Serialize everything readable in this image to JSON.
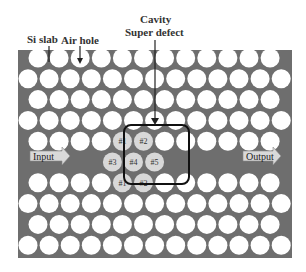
{
  "labels": {
    "si_slab": "Si slab",
    "air_hole": "Air hole",
    "cavity": "Cavity",
    "super_defect": "Super defect",
    "input": "Input",
    "output": "Output"
  },
  "cavity_holes": [
    "#1",
    "#2",
    "#3",
    "#4",
    "#5",
    "#1",
    "#2"
  ],
  "colors": {
    "slab": "#6e6e6e",
    "hole": "#ffffff",
    "cavity_hole": "#d8d8d8",
    "box": "#111111"
  }
}
